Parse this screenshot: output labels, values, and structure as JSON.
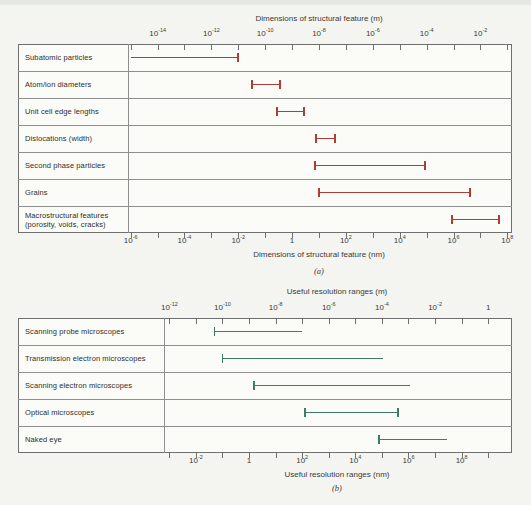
{
  "figure": {
    "background": "#f4f5f0",
    "kind": "textbook figure with two horizontal log-scale range charts"
  },
  "chart_data": [
    {
      "id": "a",
      "type": "range-bar",
      "caption": "(a)",
      "x_scale": "log10 nanometers",
      "bar_color": "#ad3d35",
      "domain_log_nm": [
        -6.1,
        8.1
      ],
      "top_axis": {
        "title": "Dimensions of structural feature (m)",
        "unit": "m",
        "labels": [
          "10^-14",
          "10^-12",
          "10^-10",
          "10^-8",
          "10^-6",
          "10^-4",
          "10^-2"
        ],
        "positions_log_nm": [
          -5,
          -3,
          -1,
          1,
          3,
          5,
          7
        ]
      },
      "bottom_axis": {
        "title": "Dimensions of structural feature (nm)",
        "unit": "nm",
        "labels": [
          "10^-6",
          "10^-4",
          "10^-2",
          "1",
          "10^2",
          "10^4",
          "10^6",
          "10^8"
        ],
        "positions_log_nm": [
          -6,
          -4,
          -2,
          0,
          2,
          4,
          6,
          8
        ]
      },
      "rows": [
        {
          "label": "Subatomic particles",
          "log10_start_nm": -6.0,
          "log10_end_nm": -2.0,
          "cap_start": false,
          "cap_end": true
        },
        {
          "label": "Atom/ion diameters",
          "log10_start_nm": -1.5,
          "log10_end_nm": -0.45,
          "cap_start": true,
          "cap_end": true
        },
        {
          "label": "Unit cell edge lengths",
          "log10_start_nm": -0.55,
          "log10_end_nm": 0.45,
          "cap_start": true,
          "cap_end": true
        },
        {
          "label": "Dislocations (width)",
          "log10_start_nm": 0.9,
          "log10_end_nm": 1.6,
          "cap_start": true,
          "cap_end": true
        },
        {
          "label": "Second phase particles",
          "log10_start_nm": 0.85,
          "log10_end_nm": 4.95,
          "cap_start": true,
          "cap_end": true
        },
        {
          "label": "Grains",
          "log10_start_nm": 1.0,
          "log10_end_nm": 6.6,
          "cap_start": true,
          "cap_end": true
        },
        {
          "label": "Macrostructural features",
          "label2": "(porosity, voids, cracks)",
          "log10_start_nm": 5.95,
          "log10_end_nm": 7.7,
          "cap_start": true,
          "cap_end": true
        }
      ]
    },
    {
      "id": "b",
      "type": "range-bar",
      "caption": "(b)",
      "x_scale": "log10 nanometers",
      "bar_color": "#3e7c6a",
      "domain_log_nm": [
        -3.2,
        9.82
      ],
      "top_axis": {
        "title": "Useful resolution ranges (m)",
        "unit": "m",
        "labels": [
          "10^-12",
          "10^-10",
          "10^-8",
          "10^-6",
          "10^-4",
          "10^-2",
          "1"
        ],
        "positions_log_nm": [
          -3,
          -1,
          1,
          3,
          5,
          7,
          9
        ]
      },
      "bottom_axis": {
        "title": "Useful resolution ranges (nm)",
        "unit": "nm",
        "labels": [
          "10^-2",
          "1",
          "10^2",
          "10^4",
          "10^6",
          "10^8"
        ],
        "positions_log_nm": [
          -2,
          0,
          2,
          4,
          6,
          8
        ]
      },
      "rows": [
        {
          "label": "Scanning probe microscopes",
          "log10_start_nm": -1.3,
          "log10_end_nm": 2.0,
          "cap_start": true,
          "cap_end": false
        },
        {
          "label": "Transmission electron microscopes",
          "log10_start_nm": -1.0,
          "log10_end_nm": 5.05,
          "cap_start": true,
          "cap_end": false
        },
        {
          "label": "Scanning electron microscopes",
          "log10_start_nm": 0.2,
          "log10_end_nm": 6.05,
          "cap_start": true,
          "cap_end": false
        },
        {
          "label": "Optical microscopes",
          "log10_start_nm": 2.1,
          "log10_end_nm": 5.6,
          "cap_start": true,
          "cap_end": true
        },
        {
          "label": "Naked eye",
          "log10_start_nm": 4.9,
          "log10_end_nm": 7.45,
          "cap_start": true,
          "cap_end": false
        }
      ]
    }
  ]
}
